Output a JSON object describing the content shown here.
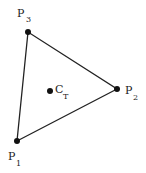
{
  "diagram": {
    "type": "triangle-centroid",
    "colors": {
      "stroke": "#222222",
      "point": "#111111",
      "background": "#ffffff"
    },
    "vertices": [
      {
        "id": "P1",
        "base": "P",
        "subscript": "1",
        "x": 17,
        "y": 141
      },
      {
        "id": "P2",
        "base": "P",
        "subscript": "2",
        "x": 117,
        "y": 89
      },
      {
        "id": "P3",
        "base": "P",
        "subscript": "3",
        "x": 28,
        "y": 32
      }
    ],
    "centroid": {
      "id": "CT",
      "base": "C",
      "subscript": "T",
      "x": 50,
      "y": 91
    }
  }
}
